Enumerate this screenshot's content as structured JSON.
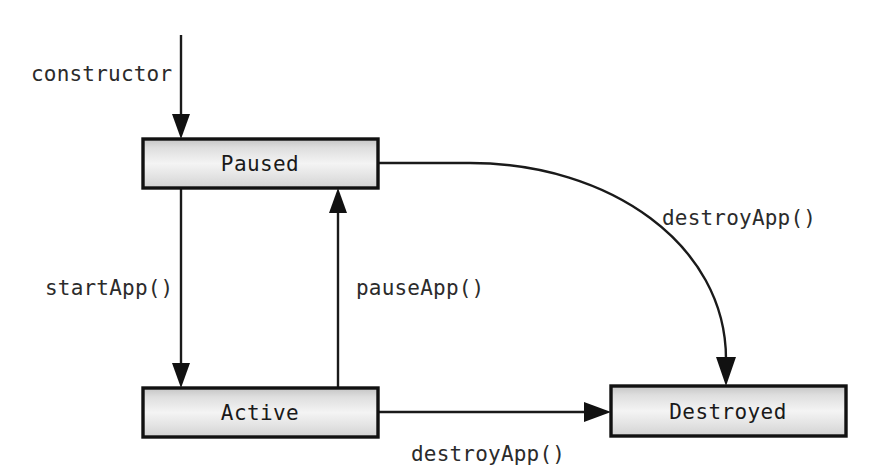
{
  "diagram": {
    "type": "state-machine",
    "background_color": "#ffffff",
    "box_border_color": "#111111",
    "box_fill_top": "#c9c9c9",
    "box_fill_mid": "#f2f2f2",
    "box_fill_bottom": "#d9d9d9",
    "line_color": "#1a1a1a",
    "text_color": "#1a1a1a",
    "states": [
      {
        "id": "paused",
        "label": "Paused",
        "x": 143,
        "y": 139,
        "width": 235,
        "height": 49,
        "label_x": 260,
        "label_y": 171
      },
      {
        "id": "active",
        "label": "Active",
        "x": 143,
        "y": 388,
        "width": 235,
        "height": 49,
        "label_x": 260,
        "label_y": 420
      },
      {
        "id": "destroyed",
        "label": "Destroyed",
        "x": 611,
        "y": 386,
        "width": 235,
        "height": 50,
        "label_x": 728,
        "label_y": 419
      }
    ],
    "transitions": [
      {
        "id": "constructor",
        "label": "constructor",
        "from": "",
        "to": "paused",
        "label_x": 31,
        "label_y": 81,
        "label_anchor": "start"
      },
      {
        "id": "start-app",
        "label": "startApp()",
        "from": "paused",
        "to": "active",
        "label_x": 45,
        "label_y": 295,
        "label_anchor": "start"
      },
      {
        "id": "pause-app",
        "label": "pauseApp()",
        "from": "active",
        "to": "paused",
        "label_x": 356,
        "label_y": 295,
        "label_anchor": "start"
      },
      {
        "id": "destroy-app-from-paused",
        "label": "destroyApp()",
        "from": "paused",
        "to": "destroyed",
        "label_x": 662,
        "label_y": 225,
        "label_anchor": "start"
      },
      {
        "id": "destroy-app-from-active",
        "label": "destroyApp()",
        "from": "active",
        "to": "destroyed",
        "label_x": 411,
        "label_y": 461,
        "label_anchor": "start"
      }
    ]
  }
}
